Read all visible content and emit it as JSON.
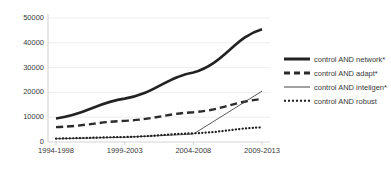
{
  "chart_data": {
    "type": "line",
    "title": "",
    "xlabel": "",
    "ylabel": "",
    "categories": [
      "1994-1998",
      "1999-2003",
      "2004-2008",
      "2009-2013"
    ],
    "ylim": [
      0,
      50000
    ],
    "yticks": [
      0,
      10000,
      20000,
      30000,
      40000,
      50000
    ],
    "ytick_labels": [
      "0",
      "10000",
      "20000",
      "30000",
      "40000",
      "50000"
    ],
    "grid": true,
    "legend_position": "right",
    "series": [
      {
        "name": "control AND network*",
        "style": "solid-thick",
        "color": "#222222",
        "values": [
          9500,
          17500,
          28000,
          45500
        ]
      },
      {
        "name": "control AND adapt*",
        "style": "dashed-thick",
        "color": "#2b2b2b",
        "values": [
          6000,
          8500,
          12000,
          17300
        ]
      },
      {
        "name": "control AND inteligen*",
        "style": "solid-thin",
        "color": "#444444",
        "values": [
          1300,
          1900,
          3200,
          20500
        ]
      },
      {
        "name": "control AND robust",
        "style": "dotted",
        "color": "#1f1f1f",
        "values": [
          1400,
          2000,
          3500,
          5900
        ]
      }
    ]
  },
  "legend": {
    "items": [
      {
        "label": "control AND network*",
        "marker": "solid-thick-line-icon"
      },
      {
        "label": "control AND adapt*",
        "marker": "dashed-thick-line-icon"
      },
      {
        "label": "control AND inteligen*",
        "marker": "solid-thin-line-icon"
      },
      {
        "label": "control AND robust",
        "marker": "dotted-line-icon"
      }
    ]
  },
  "axes": {
    "y_labels": [
      "50000",
      "40000",
      "30000",
      "20000",
      "10000",
      "0"
    ],
    "x_labels": [
      "1994-1998",
      "1999-2003",
      "2004-2008",
      "2009-2013"
    ]
  },
  "colors": {
    "grid": "#e8e8e8",
    "axis": "#c9c9c9",
    "text": "#3a3a3a",
    "background": "#ffffff"
  }
}
